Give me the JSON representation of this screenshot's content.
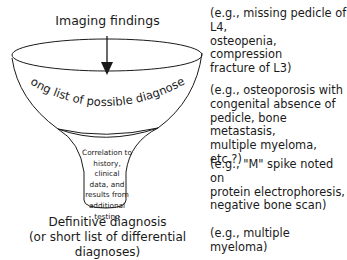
{
  "diagram": {
    "type": "funnel",
    "top_label": "Imaging findings",
    "bowl_label": "Long list of possible diagnoses",
    "stem_label": [
      "Correlation to",
      "history, clinical",
      "data, and",
      "results from",
      "additional",
      "testing"
    ],
    "bottom_label": [
      "Definitive diagnosis",
      "(or short list of differential diagnoses)"
    ],
    "examples": [
      {
        "stage": "imaging",
        "text": "(e.g., missing pedicle of L4,\nosteopenia, compression\nfracture of L3)"
      },
      {
        "stage": "possible-diagnoses",
        "text": "(e.g., osteoporosis with\ncongenital absence of\npedicle, bone metastasis,\nmultiple myeloma, etc.?)"
      },
      {
        "stage": "correlation",
        "text": "(e.g., \"M\" spike noted on\nprotein electrophoresis,\nnegative bone scan)"
      },
      {
        "stage": "definitive",
        "text": "(e.g., multiple myeloma)"
      }
    ],
    "colors": {
      "stroke": "#1a1a1a",
      "background": "#ffffff"
    }
  }
}
